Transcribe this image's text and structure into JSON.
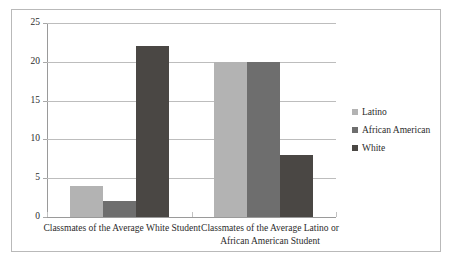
{
  "chart_data": {
    "type": "bar",
    "title": "",
    "xlabel": "",
    "ylabel": "",
    "ylim": [
      0,
      25
    ],
    "ytick_values": [
      0,
      5,
      10,
      15,
      20,
      25
    ],
    "ytick_labels": [
      "0",
      "5",
      "10",
      "15",
      "20",
      "25"
    ],
    "grid": true,
    "legend_position": "right",
    "categories": [
      "Classmates of the Average White Student",
      "Classmates of the Average Latino or African American Student"
    ],
    "series": [
      {
        "name": "Latino",
        "values": [
          4,
          20
        ],
        "color": "#b3b3b3"
      },
      {
        "name": "African American",
        "values": [
          2,
          20
        ],
        "color": "#6e6e6e"
      },
      {
        "name": "White",
        "values": [
          22,
          8
        ],
        "color": "#4a4744"
      }
    ]
  },
  "legend": {
    "items": [
      {
        "label": "Latino",
        "color": "#b3b3b3"
      },
      {
        "label": "African American",
        "color": "#6e6e6e"
      },
      {
        "label": "White",
        "color": "#4a4744"
      }
    ]
  },
  "axis": {
    "grid_color": "#bdbdbd",
    "axis_color": "#9a9a9a",
    "frame_color": "#b9b9b9"
  }
}
